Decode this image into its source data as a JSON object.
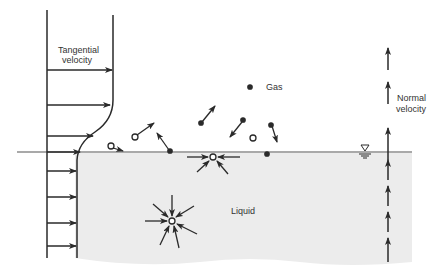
{
  "labels": {
    "tangential_line1": "Tangential",
    "tangential_line2": "velocity",
    "normal_line1": "Normal",
    "normal_line2": "velocity",
    "gas": "Gas",
    "liquid": "Liquid"
  },
  "colors": {
    "ink": "#2a2a2a",
    "liquid_fill": "#ececec",
    "background": "#ffffff"
  },
  "symbols": {
    "free_surface": "water-level-triangle-symbol"
  }
}
